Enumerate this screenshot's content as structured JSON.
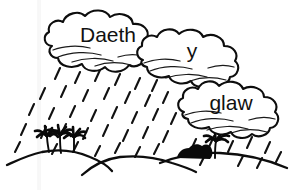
{
  "image": {
    "kind": "line-drawing",
    "title": "Daeth y glaw",
    "background_color": "#ffffff",
    "ink_color": "#0d0d0d",
    "width": 293,
    "height": 190
  },
  "clouds": [
    {
      "id": "cloud-daeth",
      "label": "Daeth",
      "label_x": 108,
      "label_y": 36,
      "font_size": 21,
      "box": {
        "x": 42,
        "y": 11,
        "w": 126,
        "h": 64
      }
    },
    {
      "id": "cloud-y",
      "label": "y",
      "label_x": 192,
      "label_y": 52,
      "font_size": 21,
      "box": {
        "x": 134,
        "y": 27,
        "w": 113,
        "h": 58
      }
    },
    {
      "id": "cloud-glaw",
      "label": "glaw",
      "label_x": 231,
      "label_y": 104,
      "font_size": 21,
      "box": {
        "x": 175,
        "y": 80,
        "w": 112,
        "h": 56
      }
    }
  ],
  "scene": {
    "phrase": "Daeth y glaw",
    "weather": "rain",
    "rain_streak_count": 46,
    "hills": [
      {
        "name": "left-hill"
      },
      {
        "name": "middle-hill"
      },
      {
        "name": "right-hill"
      }
    ],
    "palm_trees_left": 3,
    "palm_trees_right": 1,
    "dark_shapes_right": 1
  },
  "icon_names": {
    "cloud": "cloud-icon",
    "rain": "rain-streaks-icon",
    "palm": "palm-tree-icon",
    "hill": "hill-icon",
    "bush": "dark-bush-icon"
  }
}
